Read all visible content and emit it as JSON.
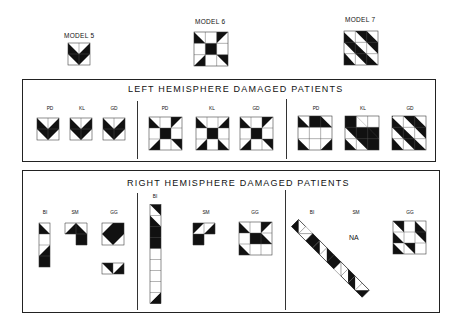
{
  "models": [
    {
      "label": "MODEL 5",
      "id": "model-5"
    },
    {
      "label": "MODEL 6",
      "id": "model-6"
    },
    {
      "label": "MODEL 7",
      "id": "model-7"
    }
  ],
  "left_panel": {
    "title": "LEFT HEMISPHERE DAMAGED PATIENTS",
    "groups": [
      {
        "model": "MODEL 5",
        "patients": [
          "PD",
          "KL",
          "GD"
        ]
      },
      {
        "model": "MODEL 6",
        "patients": [
          "PD",
          "KL",
          "GD"
        ]
      },
      {
        "model": "MODEL 7",
        "patients": [
          "PD",
          "KL",
          "GD"
        ]
      }
    ]
  },
  "right_panel": {
    "title": "RIGHT HEMISPHERE DAMAGED PATIENTS",
    "groups": [
      {
        "model": "MODEL 5",
        "patients": [
          "BI",
          "SM",
          "GG"
        ]
      },
      {
        "model": "MODEL 6",
        "patients": [
          "BI",
          "SM",
          "GG"
        ]
      },
      {
        "model": "MODEL 7",
        "patients": [
          "BI",
          "SM",
          "GG"
        ]
      }
    ],
    "na_text": "NA"
  }
}
